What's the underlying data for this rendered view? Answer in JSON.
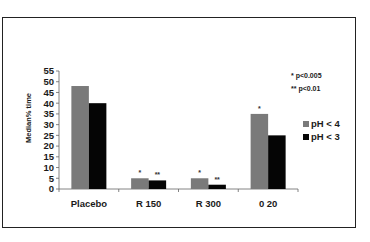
{
  "chart_data": {
    "type": "bar",
    "title": "",
    "xlabel": "",
    "ylabel": "Median% time",
    "ylim": [
      0,
      55
    ],
    "yticks": [
      0,
      5,
      10,
      15,
      20,
      25,
      30,
      35,
      40,
      45,
      50,
      55
    ],
    "grid": false,
    "legend_position": "right",
    "categories": [
      "Placebo",
      "R 150",
      "R 300",
      "0 20"
    ],
    "series": [
      {
        "name": "pH < 4",
        "color": "#7a7a7a",
        "values": [
          48,
          5,
          5,
          35
        ],
        "significance": [
          "",
          "*",
          "*",
          "*"
        ]
      },
      {
        "name": "pH < 3",
        "color": "#050505",
        "values": [
          40,
          4,
          2,
          25
        ],
        "significance": [
          "",
          "**",
          "**",
          ""
        ]
      }
    ],
    "annotations": [
      "* p<0.005",
      "** p<0.01"
    ]
  }
}
